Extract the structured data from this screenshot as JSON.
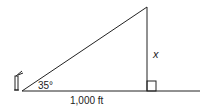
{
  "diagram": {
    "type": "right-triangle-trig",
    "angle_label": "35°",
    "base_label": "1,000 ft",
    "height_label": "x",
    "right_angle_marker": true,
    "observer_icon": "person-with-telescope-icon",
    "colors": {
      "line": "#222222",
      "background": "#ffffff"
    }
  }
}
